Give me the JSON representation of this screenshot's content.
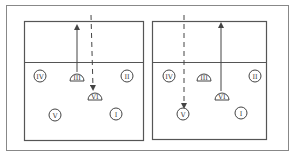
{
  "diagram": {
    "type": "volleyball-rotation",
    "colors": {
      "line": "#555555",
      "frame": "#888888",
      "background": "#ffffff"
    },
    "frame": {
      "x": 6,
      "y": 5,
      "width": 282,
      "height": 145
    },
    "courts": [
      {
        "id": "left",
        "bounds": {
          "x": 24,
          "y": 21,
          "width": 119,
          "height": 119
        },
        "net_y": 62,
        "players": [
          {
            "label": "IV",
            "shape": "circle",
            "x": 40,
            "y": 76
          },
          {
            "label": "III",
            "shape": "dome",
            "x": 77,
            "y": 77
          },
          {
            "label": "II",
            "shape": "circle",
            "x": 127,
            "y": 76
          },
          {
            "label": "VI",
            "shape": "dome",
            "x": 95,
            "y": 96
          },
          {
            "label": "V",
            "shape": "circle",
            "x": 55,
            "y": 115
          },
          {
            "label": "I",
            "shape": "circle",
            "x": 116,
            "y": 114
          }
        ],
        "arrows": [
          {
            "style": "solid",
            "from": [
              77,
              72
            ],
            "to": [
              77,
              27
            ],
            "meaning": "player III moves up to net"
          },
          {
            "style": "dashed",
            "from": [
              91,
              15
            ],
            "to": [
              93,
              88
            ],
            "meaning": "incoming ball to player VI"
          }
        ]
      },
      {
        "id": "right",
        "bounds": {
          "x": 152,
          "y": 21,
          "width": 114,
          "height": 118
        },
        "net_y": 62,
        "players": [
          {
            "label": "IV",
            "shape": "circle",
            "x": 169,
            "y": 76
          },
          {
            "label": "III",
            "shape": "dome",
            "x": 204,
            "y": 77
          },
          {
            "label": "II",
            "shape": "circle",
            "x": 255,
            "y": 76
          },
          {
            "label": "VI",
            "shape": "dome",
            "x": 222,
            "y": 96
          },
          {
            "label": "V",
            "shape": "circle",
            "x": 183,
            "y": 114
          },
          {
            "label": "I",
            "shape": "circle",
            "x": 241,
            "y": 113
          }
        ],
        "arrows": [
          {
            "style": "solid",
            "from": [
              221,
              91
            ],
            "to": [
              221,
              25
            ],
            "meaning": "player VI moves up to net"
          },
          {
            "style": "dashed",
            "from": [
              184,
              15
            ],
            "to": [
              184,
              106
            ],
            "meaning": "incoming ball to player V"
          }
        ]
      }
    ]
  }
}
